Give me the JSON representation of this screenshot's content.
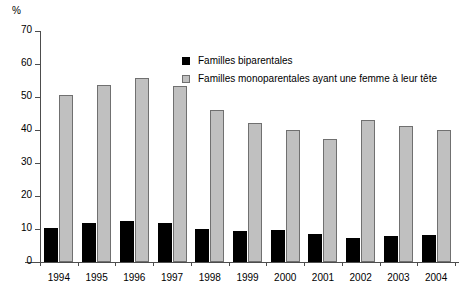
{
  "chart_data": {
    "type": "bar",
    "title": "",
    "subtitle": "",
    "xlabel": "",
    "ylabel": "%",
    "unit_label": "%",
    "ylim": [
      0,
      70
    ],
    "ytick_step": 10,
    "yticks": [
      0,
      10,
      20,
      30,
      40,
      50,
      60,
      70
    ],
    "ytick_labels": [
      "0",
      "10",
      "20",
      "30",
      "40",
      "50",
      "60",
      "70"
    ],
    "grid": false,
    "legend_position": "upper center",
    "categories": [
      "1994",
      "1995",
      "1996",
      "1997",
      "1998",
      "1999",
      "2000",
      "2001",
      "2002",
      "2003",
      "2004"
    ],
    "series": [
      {
        "name": "Familles biparentales",
        "color": "#000000",
        "values": [
          10.2,
          11.7,
          12.3,
          11.8,
          10.0,
          9.4,
          9.8,
          8.5,
          7.2,
          7.8,
          8.3
        ]
      },
      {
        "name": "Familles monoparentales ayant une femme à leur tête",
        "color": "#c0c0c0",
        "values": [
          50.5,
          53.5,
          55.7,
          53.2,
          46.1,
          42.1,
          40.1,
          37.4,
          43.0,
          41.3,
          40.1
        ]
      }
    ]
  },
  "legend": {
    "items": [
      {
        "label": "Familles biparentales",
        "swatch": "dark"
      },
      {
        "label": "Familles monoparentales ayant une femme à leur tête",
        "swatch": "light"
      }
    ]
  },
  "colors": {
    "dark_bar": "#000000",
    "light_bar": "#c0c0c0",
    "light_bar_border": "#707070",
    "axis": "#4d4d4d",
    "background": "#ffffff",
    "text": "#000000"
  }
}
